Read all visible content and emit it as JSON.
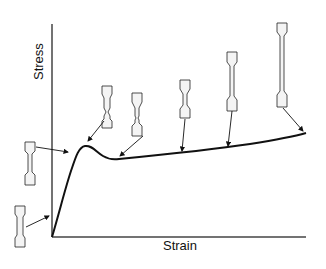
{
  "diagram": {
    "title": "",
    "x_axis_label": "Strain",
    "y_axis_label": "Stress",
    "curve": {
      "description": "Stress-strain curve of a ductile polymer: linear elastic rise, yield peak, drop into necking, then gradual strain-hardening rise during cold drawing",
      "points": [
        [
          0,
          0
        ],
        [
          0.05,
          0.45
        ],
        [
          0.11,
          0.9
        ],
        [
          0.15,
          1.0
        ],
        [
          0.21,
          0.85
        ],
        [
          0.27,
          0.8
        ],
        [
          0.5,
          0.83
        ],
        [
          0.75,
          0.88
        ],
        [
          1.0,
          0.94
        ]
      ]
    },
    "specimens": [
      {
        "id": "s1",
        "stage": "initial elastic loading",
        "shape": "undeformed dogbone"
      },
      {
        "id": "s2",
        "stage": "approaching yield",
        "shape": "slightly stretched dogbone"
      },
      {
        "id": "s3",
        "stage": "yield point",
        "shape": "neck forming"
      },
      {
        "id": "s4",
        "stage": "post-yield drop",
        "shape": "neck fully formed"
      },
      {
        "id": "s5",
        "stage": "cold drawing",
        "shape": "neck propagating"
      },
      {
        "id": "s6",
        "stage": "cold drawing continued",
        "shape": "long drawn neck"
      },
      {
        "id": "s7",
        "stage": "strain hardening before fracture",
        "shape": "fully drawn specimen"
      }
    ],
    "colors": {
      "line": "#111111",
      "axis": "#333333",
      "specimen_fill": "#f4f4f4"
    }
  }
}
